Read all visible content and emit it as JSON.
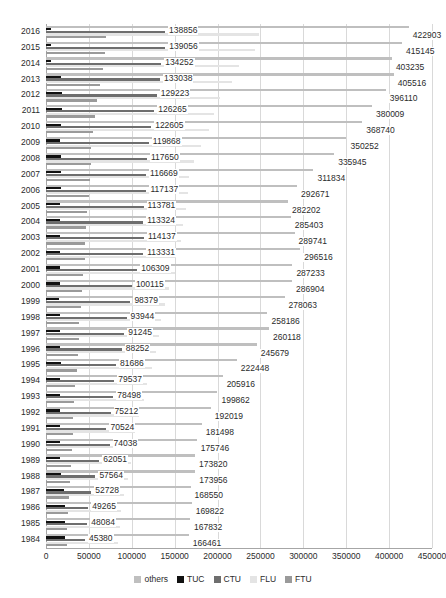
{
  "chart_data": {
    "type": "bar",
    "orientation": "horizontal",
    "title": "",
    "xlabel": "",
    "ylabel": "",
    "xlim": [
      0,
      450000
    ],
    "xticks": [
      0,
      50000,
      100000,
      150000,
      200000,
      250000,
      300000,
      350000,
      400000,
      450000
    ],
    "xtick_labels": [
      "0",
      "50000",
      "100000",
      "150000",
      "200000",
      "250000",
      "300000",
      "350000",
      "400000",
      "450000"
    ],
    "grid": true,
    "legend_position": "bottom",
    "legend": [
      "others",
      "TUC",
      "CTU",
      "FLU",
      "FTU"
    ],
    "series_colors": {
      "others": "#bfbfbf",
      "TUC": "#111111",
      "CTU": "#6e6e6e",
      "FLU": "#e4e4e4",
      "FTU": "#9a9a9a"
    },
    "categories": [
      "2016",
      "2015",
      "2014",
      "2013",
      "2012",
      "2011",
      "2010",
      "2009",
      "2008",
      "2007",
      "2006",
      "2005",
      "2004",
      "2003",
      "2002",
      "2001",
      "2000",
      "1999",
      "1998",
      "1997",
      "1996",
      "1995",
      "1994",
      "1993",
      "1992",
      "1991",
      "1990",
      "1989",
      "1988",
      "1987",
      "1986",
      "1985",
      "1984"
    ],
    "series": [
      {
        "name": "others",
        "values": [
          422903,
          415145,
          403235,
          405516,
          396110,
          380009,
          368740,
          350252,
          335945,
          311834,
          292671,
          282202,
          285403,
          289741,
          296516,
          287233,
          286904,
          278063,
          258186,
          260118,
          245679,
          222448,
          205916,
          199862,
          192019,
          181498,
          175746,
          173820,
          173956,
          168550,
          169822,
          167832,
          166461
        ]
      },
      {
        "name": "TUC",
        "values": [
          5331,
          5510,
          5810,
          17520,
          18340,
          19230,
          17250,
          16560,
          17960,
          17240,
          17050,
          16530,
          16400,
          16350,
          16100,
          15900,
          15800,
          15700,
          16000,
          16400,
          16700,
          17200,
          16900,
          16500,
          16100,
          16300,
          16600,
          16800,
          17100,
          20500,
          21600,
          21900,
          21800
        ]
      },
      {
        "name": "CTU",
        "values": [
          138856,
          139056,
          134252,
          133038,
          129223,
          126265,
          122605,
          119868,
          117650,
          116669,
          117137,
          113781,
          113324,
          114137,
          113331,
          106309,
          100115,
          98379,
          93944,
          91245,
          88252,
          81686,
          79537,
          78498,
          75212,
          70524,
          74038,
          62051,
          57564,
          52728,
          49265,
          48084,
          45380
        ]
      },
      {
        "name": "FLU",
        "values": [
          248000,
          244000,
          225000,
          217000,
          203000,
          196000,
          190000,
          181000,
          172000,
          167000,
          165000,
          163000,
          160000,
          157000,
          152000,
          150000,
          143000,
          139000,
          134000,
          132000,
          128000,
          123000,
          118000,
          114000,
          108000,
          104000,
          101000,
          99000,
          96000,
          91000,
          88000,
          86000,
          84000
        ]
      },
      {
        "name": "FTU",
        "values": [
          70000,
          69000,
          66000,
          63000,
          59000,
          57000,
          55000,
          53000,
          52000,
          51000,
          50000,
          48000,
          47000,
          46000,
          45000,
          43000,
          42000,
          41000,
          39000,
          38000,
          37000,
          36000,
          34000,
          33000,
          32000,
          31000,
          30000,
          29000,
          28000,
          27000,
          26000,
          25000,
          24000
        ]
      }
    ],
    "ctu_labels": [
      "138856",
      "139056",
      "134252",
      "133038",
      "129223",
      "126265",
      "122605",
      "119868",
      "117650",
      "116669",
      "117137",
      "113781",
      "113324",
      "114137",
      "113331",
      "106309",
      "100115",
      "98379",
      "93944",
      "91245",
      "88252",
      "81686",
      "79537",
      "78498",
      "75212",
      "70524",
      "74038",
      "62051",
      "57564",
      "52728",
      "49265",
      "48084",
      "45380"
    ],
    "others_labels": [
      "422903",
      "415145",
      "403235",
      "405516",
      "396110",
      "380009",
      "368740",
      "350252",
      "335945",
      "311834",
      "292671",
      "282202",
      "285403",
      "289741",
      "296516",
      "287233",
      "286904",
      "278063",
      "258186",
      "260118",
      "245679",
      "222448",
      "205916",
      "199862",
      "192019",
      "181498",
      "175746",
      "173820",
      "173956",
      "168550",
      "169822",
      "167832",
      "166461"
    ]
  }
}
